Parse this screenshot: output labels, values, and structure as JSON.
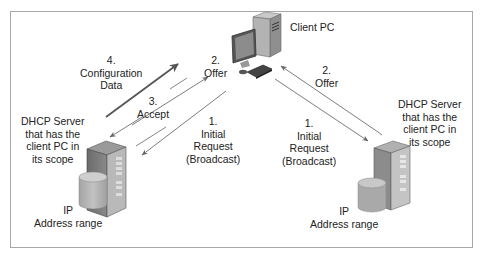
{
  "diagram": {
    "type": "network-flow",
    "topic": "DHCP address assignment",
    "nodes": {
      "client": {
        "label": "Client PC",
        "icon": "desktop-computer-icon"
      },
      "left_server": {
        "label_lines": [
          "DHCP Server",
          "that has the",
          "client PC in",
          "its scope"
        ],
        "icon": "server-tower-icon",
        "storage_label_lines": [
          "IP",
          "Address range"
        ],
        "storage_icon": "database-cylinder-icon"
      },
      "right_server": {
        "label_lines": [
          "DHCP Server",
          "that has the",
          "client PC in",
          "its scope"
        ],
        "icon": "server-tower-icon",
        "storage_label_lines": [
          "IP",
          "Address range"
        ],
        "storage_icon": "database-cylinder-icon"
      }
    },
    "left_flow": [
      {
        "step": "1.",
        "lines": [
          "Initial",
          "Request",
          "(Broadcast)"
        ],
        "direction": "client-to-server"
      },
      {
        "step": "2.",
        "lines": [
          "Offer"
        ],
        "direction": "server-to-client"
      },
      {
        "step": "3.",
        "lines": [
          "Accept"
        ],
        "direction": "client-to-server"
      },
      {
        "step": "4.",
        "lines": [
          "Configuration",
          "Data"
        ],
        "direction": "server-to-client"
      }
    ],
    "right_flow": [
      {
        "step": "1.",
        "lines": [
          "Initial",
          "Request",
          "(Broadcast)"
        ],
        "direction": "client-to-server"
      },
      {
        "step": "2.",
        "lines": [
          "Offer"
        ],
        "direction": "server-to-client"
      }
    ],
    "colors": {
      "frame": "#a8a8a8",
      "arrow": "#6e6e6e",
      "arrow_bold": "#555555",
      "server_body": "#7a7a7a",
      "cylinder": "#b5b5b5"
    }
  }
}
